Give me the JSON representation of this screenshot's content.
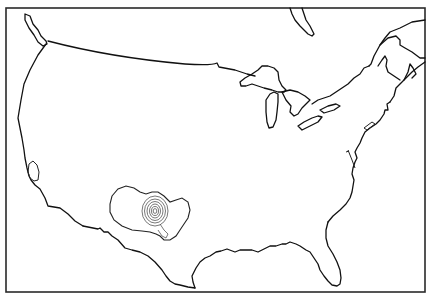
{
  "map": {
    "title": "",
    "region": "Continental United States",
    "frame": {
      "x": 6,
      "y": 8,
      "width": 419,
      "height": 284
    },
    "colors": {
      "background": "#ffffff",
      "coastline": "#111111",
      "frame": "#2a2a2a",
      "contour": "#555555"
    },
    "contour_field": {
      "center": {
        "x": 155,
        "y": 211
      },
      "levels": 6,
      "location": "Texas / Oklahoma panhandle region"
    }
  }
}
